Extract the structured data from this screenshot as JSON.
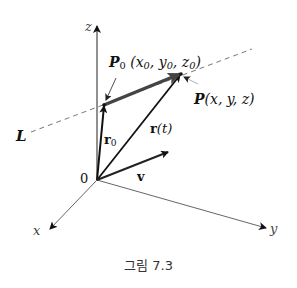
{
  "figure": {
    "caption": "그림 7.3",
    "axes": {
      "origin_label": "0",
      "x_label": "x",
      "y_label": "y",
      "z_label": "z"
    },
    "line": {
      "label": "L",
      "style": "dashed"
    },
    "points": {
      "p0": {
        "name": "P",
        "sub": "0",
        "coords": "(x",
        "c1sub": "0",
        "c2": ", y",
        "c2sub": "0",
        "c3": ", z",
        "c3sub": "0",
        "close": ")"
      },
      "p": {
        "name": "P",
        "coords": "(x, y, z)"
      }
    },
    "vectors": {
      "r0": {
        "name": "r",
        "sub": "0"
      },
      "rt": {
        "name": "r",
        "arg": "(t)"
      },
      "v": {
        "name": "v"
      }
    },
    "colors": {
      "axis": "#555555",
      "vector": "#111111",
      "direction_vector": "#444444",
      "dashed_line": "#777777"
    }
  }
}
